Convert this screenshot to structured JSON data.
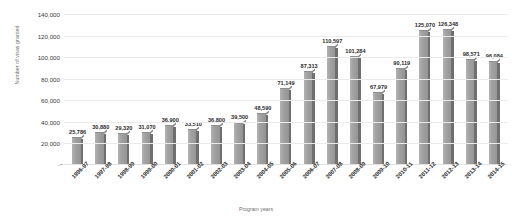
{
  "chart_data": {
    "type": "bar",
    "title": "",
    "xlabel": "Program years",
    "ylabel": "Number of visas granted",
    "ylim": [
      0,
      140000
    ],
    "ytick_labels": [
      "140,000",
      "120,000",
      "100,000",
      "80,000",
      "60,000",
      "40,000",
      "20,000",
      "-"
    ],
    "ytick_values": [
      140000,
      120000,
      100000,
      80000,
      60000,
      40000,
      20000,
      0
    ],
    "grid": true,
    "legend": "none",
    "bar_color": "#9a9a9a",
    "bar_side_color": "#6f6f6f",
    "gridline_color": "#ebebeb",
    "categories": [
      "1996-97",
      "1997-98",
      "1998-99",
      "1999-00",
      "2000-01",
      "2001-02",
      "2002-03",
      "2003-04",
      "2004-05",
      "2005-06",
      "2006-07",
      "2007-08",
      "2008-09",
      "2009-10",
      "2010-11",
      "2011-12",
      "2012-13",
      "2013-14",
      "2014-15"
    ],
    "values": [
      25786,
      30880,
      29320,
      31070,
      36900,
      33510,
      36800,
      39500,
      48590,
      71149,
      87313,
      110597,
      101284,
      67979,
      90119,
      125070,
      126348,
      98571,
      96084
    ],
    "data_labels": [
      "25,786",
      "30,880",
      "29,320",
      "31,070",
      "36,900",
      "33,510",
      "36,800",
      "39,500",
      "48,590",
      "71,149",
      "87,313",
      "110,597",
      "101,284",
      "67,979",
      "90,119",
      "125,070",
      "126,348",
      "98,571",
      "96,084"
    ]
  }
}
